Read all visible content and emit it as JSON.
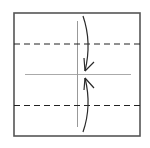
{
  "diagram": {
    "type": "origami-fold-step",
    "colors": {
      "background": "#ffffff",
      "paper_edge": "#555555",
      "fold_line": "#222222",
      "crease": "#aaaaaa",
      "arrow": "#2a2a2a"
    },
    "paper": {
      "x": 14,
      "y": 13,
      "width": 126,
      "height": 123
    },
    "dashed_lines": [
      {
        "name": "upper-valley-fold",
        "y": 44
      },
      {
        "name": "lower-valley-fold",
        "y": 105
      }
    ],
    "creases": [
      {
        "name": "horizontal-center-crease",
        "x1": 25,
        "y1": 74,
        "x2": 131,
        "y2": 74
      },
      {
        "name": "vertical-center-crease",
        "x1": 77,
        "y1": 21,
        "x2": 77,
        "y2": 127
      }
    ],
    "arrows": [
      {
        "name": "fold-down-arrow",
        "direction": "down"
      },
      {
        "name": "fold-up-arrow",
        "direction": "up"
      }
    ]
  }
}
